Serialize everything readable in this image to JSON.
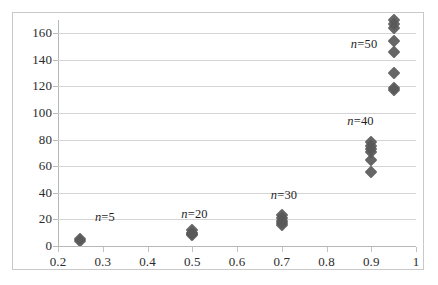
{
  "chart_data": {
    "type": "scatter",
    "title": "",
    "xlabel": "",
    "ylabel": "",
    "xlim": [
      0.2,
      1.0
    ],
    "ylim": [
      0,
      170
    ],
    "grid": true,
    "legend_position": "none",
    "marker": {
      "shape": "diamond",
      "color": "#595959",
      "size": 9
    },
    "axes": {
      "x_ticks": [
        0.2,
        0.3,
        0.4,
        0.5,
        0.6,
        0.7,
        0.8,
        0.9,
        1.0
      ],
      "x_tick_labels": [
        "0.2",
        "0.3",
        "0.4",
        "0.5",
        "0.6",
        "0.7",
        "0.8",
        "0.9",
        "1"
      ],
      "y_ticks": [
        0,
        20,
        40,
        60,
        80,
        100,
        120,
        140,
        160
      ],
      "y_tick_labels": [
        "0",
        "20",
        "40",
        "60",
        "80",
        "100",
        "120",
        "140",
        "160"
      ]
    },
    "series": [
      {
        "name": "n=5",
        "label_prefix": "n",
        "label_suffix": "=5",
        "label_x": 0.305,
        "label_y": 22,
        "points": [
          {
            "x": 0.25,
            "y": 5
          },
          {
            "x": 0.25,
            "y": 4
          }
        ]
      },
      {
        "name": "n=20",
        "label_prefix": "n",
        "label_suffix": "=20",
        "label_x": 0.505,
        "label_y": 24,
        "points": [
          {
            "x": 0.5,
            "y": 12
          },
          {
            "x": 0.5,
            "y": 10
          },
          {
            "x": 0.5,
            "y": 9
          },
          {
            "x": 0.5,
            "y": 8
          }
        ]
      },
      {
        "name": "n=30",
        "label_prefix": "n",
        "label_suffix": "=30",
        "label_x": 0.705,
        "label_y": 38,
        "points": [
          {
            "x": 0.7,
            "y": 23
          },
          {
            "x": 0.7,
            "y": 21
          },
          {
            "x": 0.7,
            "y": 19
          },
          {
            "x": 0.7,
            "y": 17
          },
          {
            "x": 0.7,
            "y": 16
          }
        ]
      },
      {
        "name": "n=40",
        "label_prefix": "n",
        "label_suffix": "=40",
        "label_x": 0.876,
        "label_y": 94,
        "points": [
          {
            "x": 0.9,
            "y": 78
          },
          {
            "x": 0.9,
            "y": 75
          },
          {
            "x": 0.9,
            "y": 73
          },
          {
            "x": 0.9,
            "y": 71
          },
          {
            "x": 0.9,
            "y": 65
          },
          {
            "x": 0.9,
            "y": 56
          }
        ]
      },
      {
        "name": "n=50",
        "label_prefix": "n",
        "label_suffix": "=50",
        "label_x": 0.884,
        "label_y": 152,
        "points": [
          {
            "x": 0.95,
            "y": 170
          },
          {
            "x": 0.95,
            "y": 167
          },
          {
            "x": 0.95,
            "y": 164
          },
          {
            "x": 0.95,
            "y": 154
          },
          {
            "x": 0.95,
            "y": 146
          },
          {
            "x": 0.95,
            "y": 130
          },
          {
            "x": 0.95,
            "y": 119
          },
          {
            "x": 0.95,
            "y": 117
          }
        ]
      }
    ]
  }
}
